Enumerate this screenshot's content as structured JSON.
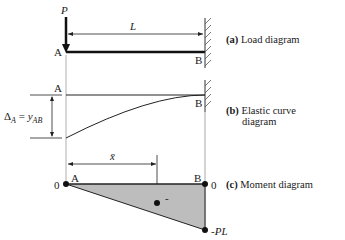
{
  "diagram": {
    "load": {
      "force_label": "P",
      "length_label": "L",
      "point_a": "A",
      "point_b": "B",
      "caption_tag": "(a)",
      "caption_text": "Load diagram"
    },
    "elastic": {
      "point_a": "A",
      "point_b": "B",
      "deflection_label": "Δ",
      "deflection_sub": "A",
      "equals": "=",
      "y_label": "y",
      "y_sub": "AB",
      "caption_tag": "(b)",
      "caption_text_line1": "Elastic curve",
      "caption_text_line2": "diagram"
    },
    "moment": {
      "xbar_label": "x̄",
      "point_a": "A",
      "point_b": "B",
      "value_left": "0",
      "value_right": "0",
      "value_min": "-PL",
      "sign": "-",
      "caption_tag": "(c)",
      "caption_text": "Moment diagram",
      "fill_color": "#bdbdbd"
    }
  }
}
